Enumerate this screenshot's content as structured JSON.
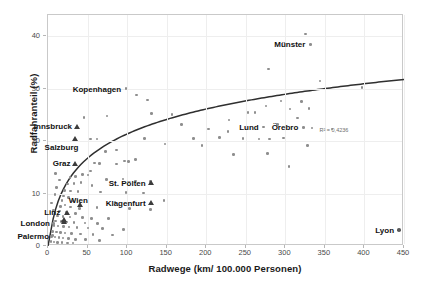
{
  "chart_data": {
    "type": "scatter",
    "title": "",
    "xlabel": "Radwege (km/ 100.000 Personen)",
    "ylabel": "Radfahranteil (%)",
    "xlim": [
      0,
      450
    ],
    "ylim": [
      0,
      44
    ],
    "xticks": [
      0,
      50,
      100,
      150,
      200,
      250,
      300,
      350,
      400,
      450
    ],
    "yticks": [
      0,
      10,
      20,
      30,
      40
    ],
    "grid": true,
    "legend": "none",
    "annotations": [
      {
        "text": "R² = 0,4236",
        "x": 395,
        "y": 22.5
      }
    ],
    "trendline": {
      "type": "logarithmic",
      "label": "R² = 0,4236",
      "r_squared": 0.4236
    },
    "series": [
      {
        "name": "Städte (Kreis)",
        "marker": "circle",
        "points": [
          {
            "x": 327,
            "y": 40.2
          },
          {
            "x": 333,
            "y": 38.2,
            "label": "Münster"
          },
          {
            "x": 280,
            "y": 33.5
          },
          {
            "x": 345,
            "y": 31.2
          },
          {
            "x": 398,
            "y": 30.0
          },
          {
            "x": 100,
            "y": 29.8,
            "label": "Kopenhagen"
          },
          {
            "x": 113,
            "y": 28.6
          },
          {
            "x": 127,
            "y": 27.6
          },
          {
            "x": 296,
            "y": 27.4
          },
          {
            "x": 322,
            "y": 27.3
          },
          {
            "x": 277,
            "y": 26.5
          },
          {
            "x": 331,
            "y": 26.0
          },
          {
            "x": 307,
            "y": 25.9
          },
          {
            "x": 254,
            "y": 25.2
          },
          {
            "x": 263,
            "y": 25.2
          },
          {
            "x": 132,
            "y": 25.0
          },
          {
            "x": 158,
            "y": 24.9
          },
          {
            "x": 317,
            "y": 24.2
          },
          {
            "x": 76,
            "y": 24.6
          },
          {
            "x": 47,
            "y": 24.3
          },
          {
            "x": 230,
            "y": 23.8
          },
          {
            "x": 291,
            "y": 22.9
          },
          {
            "x": 170,
            "y": 22.9
          },
          {
            "x": 274,
            "y": 22.5,
            "label": "Lund"
          },
          {
            "x": 324,
            "y": 22.4,
            "label": "Örebro"
          },
          {
            "x": 335,
            "y": 22.3
          },
          {
            "x": 360,
            "y": 22.1
          },
          {
            "x": 204,
            "y": 22.1
          },
          {
            "x": 229,
            "y": 21.6
          },
          {
            "x": 218,
            "y": 20.5
          },
          {
            "x": 248,
            "y": 20.3
          },
          {
            "x": 268,
            "y": 20.2
          },
          {
            "x": 281,
            "y": 20.2
          },
          {
            "x": 299,
            "y": 20.4
          },
          {
            "x": 185,
            "y": 20.3
          },
          {
            "x": 123,
            "y": 20.3
          },
          {
            "x": 63,
            "y": 20.2
          },
          {
            "x": 55,
            "y": 20.2
          },
          {
            "x": 149,
            "y": 19.2
          },
          {
            "x": 196,
            "y": 19.0
          },
          {
            "x": 329,
            "y": 18.9
          },
          {
            "x": 88,
            "y": 18.1
          },
          {
            "x": 74,
            "y": 17.8
          },
          {
            "x": 236,
            "y": 17.2
          },
          {
            "x": 279,
            "y": 17.4
          },
          {
            "x": 112,
            "y": 16.3
          },
          {
            "x": 98,
            "y": 16.0
          },
          {
            "x": 103,
            "y": 15.9
          },
          {
            "x": 88,
            "y": 15.4
          },
          {
            "x": 60,
            "y": 15.6
          },
          {
            "x": 66,
            "y": 15.5
          },
          {
            "x": 306,
            "y": 14.9
          },
          {
            "x": 55,
            "y": 14.1
          },
          {
            "x": 45,
            "y": 13.4
          },
          {
            "x": 52,
            "y": 13.3
          },
          {
            "x": 36,
            "y": 13.1
          },
          {
            "x": 29,
            "y": 12.9
          },
          {
            "x": 96,
            "y": 12.6
          },
          {
            "x": 75,
            "y": 12.5
          },
          {
            "x": 112,
            "y": 12.2
          },
          {
            "x": 131,
            "y": 12.1
          },
          {
            "x": 43,
            "y": 11.9
          },
          {
            "x": 34,
            "y": 11.7
          },
          {
            "x": 26,
            "y": 11.6
          },
          {
            "x": 57,
            "y": 11.3
          },
          {
            "x": 22,
            "y": 10.4
          },
          {
            "x": 30,
            "y": 10.3
          },
          {
            "x": 39,
            "y": 10.2
          },
          {
            "x": 68,
            "y": 10.1
          },
          {
            "x": 100,
            "y": 10.0
          },
          {
            "x": 122,
            "y": 9.9
          },
          {
            "x": 21,
            "y": 9.3
          },
          {
            "x": 27,
            "y": 9.1
          },
          {
            "x": 19,
            "y": 8.5
          },
          {
            "x": 33,
            "y": 8.4
          },
          {
            "x": 86,
            "y": 8.2
          },
          {
            "x": 148,
            "y": 8.5
          },
          {
            "x": 23,
            "y": 7.6
          },
          {
            "x": 17,
            "y": 7.3
          },
          {
            "x": 30,
            "y": 7.2
          },
          {
            "x": 41,
            "y": 7.0
          },
          {
            "x": 63,
            "y": 7.1
          },
          {
            "x": 104,
            "y": 6.9
          },
          {
            "x": 131,
            "y": 6.8
          },
          {
            "x": 15,
            "y": 6.3
          },
          {
            "x": 24,
            "y": 6.2
          },
          {
            "x": 36,
            "y": 6.0
          },
          {
            "x": 13,
            "y": 5.5
          },
          {
            "x": 20,
            "y": 5.4
          },
          {
            "x": 29,
            "y": 5.3
          },
          {
            "x": 45,
            "y": 5.2
          },
          {
            "x": 56,
            "y": 5.1
          },
          {
            "x": 78,
            "y": 5.0
          },
          {
            "x": 11,
            "y": 4.6
          },
          {
            "x": 18,
            "y": 4.5
          },
          {
            "x": 25,
            "y": 4.4
          },
          {
            "x": 34,
            "y": 4.3
          },
          {
            "x": 48,
            "y": 4.2
          },
          {
            "x": 64,
            "y": 4.1
          },
          {
            "x": 9,
            "y": 3.7
          },
          {
            "x": 14,
            "y": 3.6
          },
          {
            "x": 21,
            "y": 3.5
          },
          {
            "x": 28,
            "y": 3.4
          },
          {
            "x": 38,
            "y": 3.3
          },
          {
            "x": 52,
            "y": 3.2
          },
          {
            "x": 70,
            "y": 3.1
          },
          {
            "x": 97,
            "y": 3.0
          },
          {
            "x": 445,
            "y": 2.9,
            "label": "Lyon",
            "emphasis": true
          },
          {
            "x": 7,
            "y": 2.6
          },
          {
            "x": 12,
            "y": 2.5
          },
          {
            "x": 17,
            "y": 2.4
          },
          {
            "x": 23,
            "y": 2.3
          },
          {
            "x": 31,
            "y": 2.2
          },
          {
            "x": 42,
            "y": 2.1
          },
          {
            "x": 58,
            "y": 2.0
          },
          {
            "x": 83,
            "y": 1.9
          },
          {
            "x": 6,
            "y": 1.6
          },
          {
            "x": 10,
            "y": 1.5
          },
          {
            "x": 15,
            "y": 1.4
          },
          {
            "x": 20,
            "y": 1.3
          },
          {
            "x": 27,
            "y": 1.2
          },
          {
            "x": 36,
            "y": 1.1
          },
          {
            "x": 49,
            "y": 1.0
          },
          {
            "x": 66,
            "y": 0.9
          },
          {
            "x": 5,
            "y": 0.7
          },
          {
            "x": 9,
            "y": 0.6
          },
          {
            "x": 13,
            "y": 0.5
          },
          {
            "x": 19,
            "y": 0.5
          },
          {
            "x": 26,
            "y": 0.4
          },
          {
            "x": 33,
            "y": 0.4
          },
          {
            "x": 6,
            "y": 8.0
          },
          {
            "x": 8,
            "y": 6.6
          },
          {
            "x": 10,
            "y": 9.6
          },
          {
            "x": 12,
            "y": 11.0
          },
          {
            "x": 16,
            "y": 12.4
          },
          {
            "x": 11,
            "y": 13.6
          },
          {
            "x": 8,
            "y": 4.1,
            "label": "London"
          },
          {
            "x": 7,
            "y": 1.8,
            "label": "Palermo"
          },
          {
            "x": 16,
            "y": 6.5,
            "label": "Linz"
          }
        ]
      },
      {
        "name": "Österreichische Städte (Dreieck)",
        "marker": "triangle",
        "points": [
          {
            "x": 38,
            "y": 22.6,
            "label": "Innsbruck"
          },
          {
            "x": 36,
            "y": 20.2,
            "label": "Salzburg"
          },
          {
            "x": 36,
            "y": 15.6,
            "label": "Graz"
          },
          {
            "x": 131,
            "y": 11.9,
            "label": "St. Pölten"
          },
          {
            "x": 131,
            "y": 8.0,
            "label": "Klagenfurt"
          },
          {
            "x": 42,
            "y": 7.7,
            "label": "Wien"
          },
          {
            "x": 25,
            "y": 6.2,
            "label": "Linz-tri"
          },
          {
            "x": 22,
            "y": 4.9
          },
          {
            "x": 21,
            "y": 4.4
          }
        ]
      }
    ],
    "label_offsets": {
      "Münster": {
        "lx": 333,
        "ly": 38.2
      },
      "Kopenhagen": {
        "lx": 100,
        "ly": 29.8
      },
      "Innsbruck": {
        "lx": 38,
        "ly": 22.6
      },
      "Salzburg": {
        "lx": 46,
        "ly": 18.6
      },
      "Graz": {
        "lx": 36,
        "ly": 15.6
      },
      "St. Pölten": {
        "lx": 131,
        "ly": 11.9
      },
      "Wien": {
        "lx": 58,
        "ly": 8.6
      },
      "Klagenfurt": {
        "lx": 131,
        "ly": 8.0
      },
      "Linz": {
        "lx": 23,
        "ly": 6.3
      },
      "London": {
        "lx": 10,
        "ly": 4.1
      },
      "Palermo": {
        "lx": 9,
        "ly": 1.8
      },
      "Lund": {
        "lx": 274,
        "ly": 22.5
      },
      "Örebro": {
        "lx": 324,
        "ly": 22.4
      },
      "Lyon": {
        "lx": 445,
        "ly": 2.9
      }
    }
  }
}
